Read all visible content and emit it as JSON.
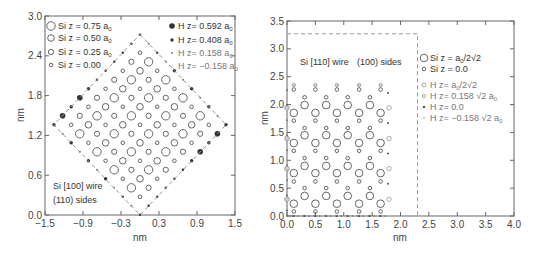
{
  "chart_data": [
    {
      "type": "scatter",
      "title": "Si [100] wire (110) sides",
      "annotation": [
        "Si [100] wire",
        "(110) sides"
      ],
      "xlabel": "nm",
      "ylabel": "nm",
      "xlim": [
        -1.5,
        1.5
      ],
      "ylim": [
        0.0,
        3.0
      ],
      "xticks": [
        "-1.5",
        "-0.9",
        "-0.3",
        "0.3",
        "0.9",
        "1.5"
      ],
      "yticks": [
        "0.0",
        "0.6",
        "1.2",
        "1.8",
        "2.4",
        "3.0"
      ],
      "grid": false,
      "legend_position": "top",
      "legend": [
        {
          "label": "Si z = 0.75 a0",
          "marker": "open-circle-large",
          "color": "#555555"
        },
        {
          "label": "Si z = 0.50 a0",
          "marker": "open-circle-medium",
          "color": "#555555"
        },
        {
          "label": "Si z = 0.25 a0",
          "marker": "open-circle-small",
          "color": "#555555"
        },
        {
          "label": "Si z = 0.00",
          "marker": "open-circle-tiny",
          "color": "#555555"
        },
        {
          "label": "H z= 0.592 a0",
          "marker": "filled-circle-large",
          "color": "#333333"
        },
        {
          "label": "H z= 0.408 a0",
          "marker": "filled-circle-medium",
          "color": "#333333"
        },
        {
          "label": "H z= 0.158 a0",
          "marker": "filled-circle-small",
          "color": "#888888"
        },
        {
          "label": "H z= -0.158 a0",
          "marker": "filled-circle-tiny",
          "color": "#aaaaaa"
        }
      ],
      "lattice": {
        "a0_nm": 0.543,
        "center_nm": [
          0.0,
          1.36
        ],
        "si_half_diag_nm": 1.1,
        "dashed_boundary_half_diag_nm": 1.36,
        "si_levels": [
          {
            "z": "0.75 a0",
            "sites_mod4": [
              [
                1,
                3
              ],
              [
                3,
                1
              ]
            ],
            "r": 4.2
          },
          {
            "z": "0.50 a0",
            "sites_mod4": [
              [
                0,
                2
              ],
              [
                2,
                0
              ]
            ],
            "r": 3.3
          },
          {
            "z": "0.25 a0",
            "sites_mod4": [
              [
                1,
                1
              ],
              [
                3,
                3
              ]
            ],
            "r": 2.6
          },
          {
            "z": "0.00",
            "sites_mod4": [
              [
                0,
                0
              ],
              [
                2,
                2
              ]
            ],
            "r": 1.8
          }
        ]
      }
    },
    {
      "type": "scatter",
      "title": "Si [110] wire (100) sides",
      "annotation": [
        "Si [110] wire",
        "(100) sides"
      ],
      "xlabel": "nm",
      "ylabel": "nm",
      "xlim": [
        0.0,
        4.0
      ],
      "ylim": [
        0.0,
        3.5
      ],
      "xticks": [
        "0.0",
        "0.5",
        "1.0",
        "1.5",
        "2.0",
        "2.5",
        "3.0",
        "3.5",
        "4.0"
      ],
      "yticks": [
        "0.0",
        "0.5",
        "1.0",
        "1.5",
        "2.0",
        "2.5",
        "3.0",
        "3.5"
      ],
      "grid": false,
      "legend_position": "right",
      "legend": [
        {
          "label": "Si z = a0/2√2",
          "marker": "open-circle-large",
          "color": "#555555"
        },
        {
          "label": "Si z = 0.0",
          "marker": "open-circle-small",
          "color": "#555555"
        },
        {
          "label": "H z= a0/2√2",
          "marker": "open-circle-gray",
          "color": "#999999"
        },
        {
          "label": "H z= 0.158 √2 a0",
          "marker": "open-circle-gray-small",
          "color": "#999999"
        },
        {
          "label": "H z= 0.0",
          "marker": "filled-circle-small",
          "color": "#555555"
        },
        {
          "label": "H z= -0.158 √2 a0",
          "marker": "filled-circle-tiny",
          "color": "#999999"
        }
      ],
      "dashed_box_nm": {
        "x": [
          0.0,
          2.3
        ],
        "y": [
          0.0,
          3.27
        ]
      },
      "columns_x_nm": [
        0.12,
        0.31,
        0.5,
        0.69,
        0.88,
        1.07,
        1.27,
        1.46,
        1.65
      ],
      "si_big_y_even_cols_nm": [
        0.22,
        0.77,
        1.31,
        1.85
      ],
      "si_big_y_odd_cols_nm": [
        0.36,
        0.9,
        1.45,
        1.99
      ],
      "si_small_y_even_cols_nm": [
        0.08,
        0.62,
        1.17,
        1.71,
        2.27
      ],
      "si_small_y_odd_cols_nm": [
        0.5,
        1.04,
        1.58,
        2.13
      ],
      "h_top_y_nm": 2.35,
      "h_left_x_nm": 0.0,
      "h_left_open_y_nm": [
        0.3,
        0.85,
        1.39,
        1.94
      ],
      "h_right_x_nm": 1.8,
      "h_right_open_y_nm": [
        0.3,
        0.85,
        1.39,
        1.94
      ],
      "h_bottom_y_nm": 0.0
    }
  ],
  "left_plot": {
    "legend_left": [
      "Si z = 0.75 a",
      "Si z = 0.50 a",
      "Si z = 0.25 a",
      "Si z = 0.00"
    ],
    "legend_left_sub": [
      "0",
      "0",
      "0",
      ""
    ],
    "legend_right": [
      "H z= 0.592 a",
      "H z= 0.408 a",
      "H z= 0.158 a",
      "H z= −0.158 a"
    ],
    "legend_right_sub": [
      "0",
      "0",
      "0",
      "0"
    ],
    "annotation_line1": "Si [100] wire",
    "annotation_line2": "(110) sides",
    "xlabel": "nm",
    "ylabel": "nm",
    "xticks": [
      "−1.5",
      "−0.9",
      "−0.3",
      "0.3",
      "0.9",
      "1.5"
    ],
    "yticks": [
      "0.0",
      "0.6",
      "1.2",
      "1.8",
      "2.4",
      "3.0"
    ]
  },
  "right_plot": {
    "legend": [
      "Si z = a",
      "Si z = 0.0",
      "H z= a",
      "H z= 0.158 √2 a",
      "H z= 0.0",
      "H z= −0.158 √2 a"
    ],
    "legend_sub": [
      "0",
      "",
      "0",
      "0",
      "",
      "0"
    ],
    "legend_tail": [
      "/2√2",
      "",
      "/2√2",
      "",
      "",
      ""
    ],
    "annotation_left": "Si [110] wire",
    "annotation_right": "(100) sides",
    "xlabel": "nm",
    "ylabel": "nm",
    "xticks": [
      "0.0",
      "0.5",
      "1.0",
      "1.5",
      "2.0",
      "2.5",
      "3.0",
      "3.5",
      "4.0"
    ],
    "yticks": [
      "0.0",
      "0.5",
      "1.0",
      "1.5",
      "2.0",
      "2.5",
      "3.0",
      "3.5"
    ]
  }
}
